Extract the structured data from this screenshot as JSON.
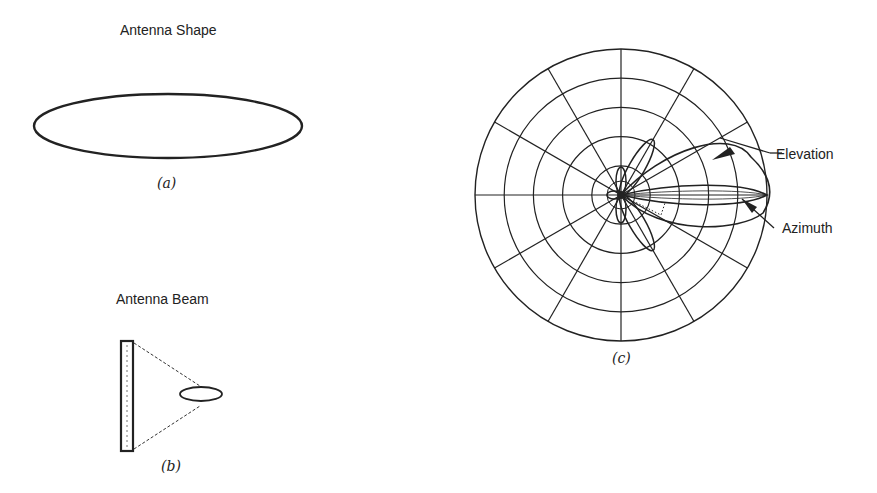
{
  "panels": {
    "a": {
      "title": "Antenna Shape",
      "caption": "(a)"
    },
    "b": {
      "title": "Antenna Beam",
      "caption": "(b)"
    },
    "c": {
      "caption": "(c)",
      "annotations": {
        "elevation": "Elevation",
        "azimuth": "Azimuth"
      },
      "polar_grid": {
        "ring_count": 5,
        "spoke_angle_step_deg": 30
      }
    }
  },
  "colors": {
    "ink": "#222222",
    "background": "#ffffff"
  }
}
